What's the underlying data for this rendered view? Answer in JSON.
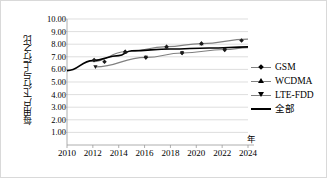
{
  "chart_data": {
    "type": "scatter",
    "title": "",
    "xlabel": "年",
    "ylabel": "每用户下行与上行之比",
    "xlim": [
      2010,
      2024
    ],
    "ylim": [
      0,
      10
    ],
    "xticks": [
      2010,
      2012,
      2014,
      2016,
      2018,
      2020,
      2022,
      2024
    ],
    "yticks": [
      "1.00",
      "2.00",
      "3.00",
      "4.00",
      "5.00",
      "6.00",
      "7.00",
      "8.00",
      "9.00",
      "10.00"
    ],
    "ytick_values": [
      1,
      2,
      3,
      4,
      5,
      6,
      7,
      8,
      9,
      10
    ],
    "grid": true,
    "grid_orientation": "horizontal",
    "legend_position": "right",
    "series": [
      {
        "name": "GSM",
        "marker": "diamond",
        "color": "#808080",
        "points": [
          {
            "x": 2012.1,
            "y": 6.75
          },
          {
            "x": 2012.9,
            "y": 6.6
          },
          {
            "x": 2014.5,
            "y": 7.4
          },
          {
            "x": 2016.1,
            "y": 6.95
          },
          {
            "x": 2017.7,
            "y": 7.8
          },
          {
            "x": 2018.9,
            "y": 7.3
          },
          {
            "x": 2020.4,
            "y": 8.05
          },
          {
            "x": 2022.2,
            "y": 7.55
          },
          {
            "x": 2023.5,
            "y": 8.3
          }
        ]
      },
      {
        "name": "WCDMA",
        "marker": "triangle-up",
        "color": "#808080",
        "trend": [
          {
            "x": 2012.0,
            "y": 6.62
          },
          {
            "x": 2014.5,
            "y": 7.4
          },
          {
            "x": 2017.7,
            "y": 7.8
          },
          {
            "x": 2020.4,
            "y": 8.05
          },
          {
            "x": 2024.0,
            "y": 8.4
          }
        ]
      },
      {
        "name": "LTE-FDD",
        "marker": "triangle-down",
        "color": "#808080",
        "trend": [
          {
            "x": 2012.2,
            "y": 6.2
          },
          {
            "x": 2016.1,
            "y": 6.95
          },
          {
            "x": 2018.9,
            "y": 7.3
          },
          {
            "x": 2022.2,
            "y": 7.58
          },
          {
            "x": 2024.0,
            "y": 7.72
          }
        ]
      },
      {
        "name": "全部",
        "marker": "none",
        "color": "#000000",
        "trend": [
          {
            "x": 2010.0,
            "y": 5.9
          },
          {
            "x": 2012.0,
            "y": 6.7
          },
          {
            "x": 2014.0,
            "y": 7.1
          },
          {
            "x": 2015.0,
            "y": 7.48
          },
          {
            "x": 2018.0,
            "y": 7.62
          },
          {
            "x": 2021.0,
            "y": 7.7
          },
          {
            "x": 2024.0,
            "y": 7.78
          }
        ]
      }
    ]
  },
  "legend": {
    "items": [
      {
        "label": "GSM",
        "marker": "diamond-marker"
      },
      {
        "label": "WCDMA",
        "marker": "triangle-up-marker"
      },
      {
        "label": "LTE-FDD",
        "marker": "triangle-down-marker"
      },
      {
        "label": "全部",
        "marker": "solid-line-marker"
      }
    ]
  }
}
